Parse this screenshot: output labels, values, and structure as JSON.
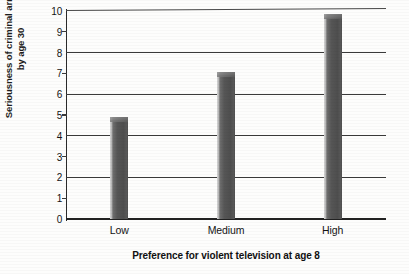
{
  "chart_data": {
    "type": "bar",
    "title": "",
    "categories": [
      "Low",
      "Medium",
      "High"
    ],
    "values": [
      4.9,
      7.05,
      9.85
    ],
    "xlabel": "Preference for violent television at age 8",
    "ylabel_line1": "Seriousness of criminal arrests",
    "ylabel_line2": "by age 30",
    "ylim": [
      0,
      10
    ],
    "yticks": [
      0,
      1,
      2,
      3,
      4,
      5,
      6,
      7,
      8,
      9,
      10
    ],
    "ytick_labels": [
      "0",
      "1",
      "2",
      "3",
      "4",
      "5",
      "6",
      "7",
      "8",
      "9",
      "10"
    ],
    "major_gridline_values": [
      0,
      2,
      4,
      6,
      8,
      10
    ],
    "minor_tick_values": [
      1,
      3,
      5,
      7,
      9
    ],
    "grid": true,
    "legend": "none",
    "bar_color": "#555555",
    "gridline_color": "#3a3a3a",
    "axis_color": "#2a2a2a",
    "background_color": "#fdfdfc"
  }
}
